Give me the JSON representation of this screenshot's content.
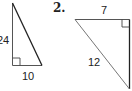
{
  "problems": [
    {
      "number": "",
      "triangle": {
        "right_angle": "bottom-left",
        "sides": {
          "vertical_leg": "24",
          "horizontal_leg": "10",
          "hypotenuse": ""
        }
      }
    },
    {
      "number": "2.",
      "triangle": {
        "right_angle": "top-right",
        "sides": {
          "horizontal_leg": "7",
          "hypotenuse": "12",
          "vertical_leg": ""
        }
      }
    }
  ],
  "colors": {
    "line": "#333333",
    "hypotenuse": "#444444",
    "text": "#222222"
  }
}
